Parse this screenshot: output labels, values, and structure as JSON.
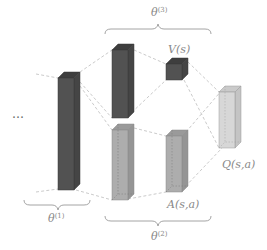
{
  "diagram": {
    "ellipsis": "…",
    "labels": {
      "value": "V(s)",
      "advantage": "A(s,a)",
      "q_value": "Q(s,a)",
      "theta1": "θ",
      "theta1_sup": "(1)",
      "theta2": "θ",
      "theta2_sup": "(2)",
      "theta3": "θ",
      "theta3_sup": "(3)"
    },
    "colors": {
      "dark_layer": "#505050",
      "mid_layer": "#a4a4a4",
      "light_layer": "#d2d2d2",
      "connection": "#c4c4c4",
      "label": "#888888"
    },
    "layers": [
      {
        "name": "shared-conv-layer",
        "shade": "dark",
        "group": "theta1"
      },
      {
        "name": "value-stream-hidden",
        "shade": "dark",
        "group": "theta3"
      },
      {
        "name": "value-output",
        "shade": "dark",
        "group": "theta3",
        "label": "V(s)"
      },
      {
        "name": "advantage-stream-hidden",
        "shade": "mid",
        "group": "theta2"
      },
      {
        "name": "advantage-output",
        "shade": "mid",
        "group": "theta2",
        "label": "A(s,a)"
      },
      {
        "name": "q-output",
        "shade": "light",
        "label": "Q(s,a)"
      }
    ]
  }
}
